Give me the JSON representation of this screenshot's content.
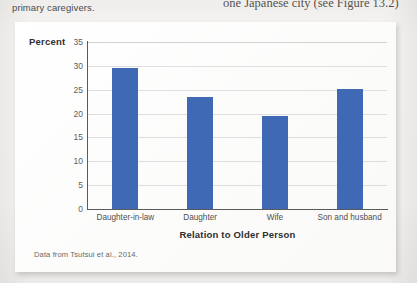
{
  "page": {
    "left_column_text": "primary caregivers.",
    "right_column_text": "one Japanese city (see Figure 13.2)"
  },
  "figure": {
    "source_note": "Data from Tsutsui et al., 2014."
  },
  "colors": {
    "bar": "#4069b5",
    "axis": "#5a5a5a",
    "gridline": "#dedede",
    "page_background": "#f4f3f1",
    "panel_background": "#fdfdfc"
  },
  "chart_data": {
    "type": "bar",
    "title": "",
    "xlabel": "Relation to Older Person",
    "ylabel": "Percent",
    "categories": [
      "Daughter-in-law",
      "Daughter",
      "Wife",
      "Son and husband"
    ],
    "values": [
      29.5,
      23.4,
      19.4,
      25.2
    ],
    "ylim": [
      0,
      35
    ],
    "yticks": [
      0,
      5,
      10,
      15,
      20,
      25,
      30,
      35
    ],
    "ytick_labels": [
      "0",
      "5",
      "10",
      "15",
      "20",
      "25",
      "30",
      "35"
    ],
    "grid": "horizontal",
    "legend": "none",
    "series_color": "#4069b5"
  }
}
